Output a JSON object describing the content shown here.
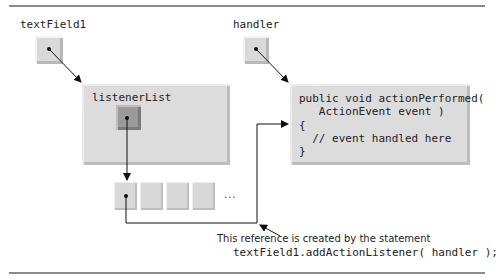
{
  "diagram": {
    "references": {
      "text_field": {
        "label": "textField1"
      },
      "handler": {
        "label": "handler"
      }
    },
    "objects": {
      "jtextfield": {
        "type_name": "JTextField",
        "suffix": "object",
        "field_label": "listenerList"
      },
      "handler_obj": {
        "type_name": "TextFieldHandler",
        "suffix": "object",
        "code_lines": [
          "public void actionPerformed(",
          "   ActionEvent event )",
          "{",
          "  // event handled here",
          "}"
        ]
      }
    },
    "listener_array": {
      "cell_count": 4,
      "ellipsis": "..."
    },
    "caption": {
      "line1": "This reference is created by the statement",
      "line2": "textField1.addActionListener( handler );"
    },
    "colors": {
      "box_fill": "#dcdcdc",
      "dark_ref_fill": "#9a9a9a",
      "rule": "#8a8a8a",
      "arrow": "#111111"
    }
  }
}
